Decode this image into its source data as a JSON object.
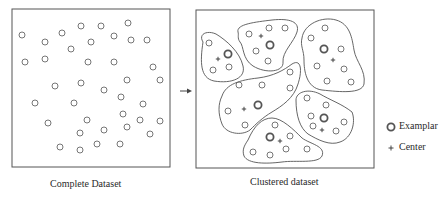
{
  "colors": {
    "stroke": "#555555",
    "point": "#666666",
    "exemplar": "#555555",
    "text": "#2a2a2a"
  },
  "left_panel": {
    "label": "Complete Dataset",
    "points": [
      [
        22,
        35
      ],
      [
        45,
        42
      ],
      [
        62,
        33
      ],
      [
        81,
        26
      ],
      [
        101,
        26
      ],
      [
        128,
        23
      ],
      [
        114,
        36
      ],
      [
        131,
        40
      ],
      [
        147,
        40
      ],
      [
        91,
        42
      ],
      [
        71,
        49
      ],
      [
        25,
        62
      ],
      [
        45,
        59
      ],
      [
        88,
        62
      ],
      [
        114,
        62
      ],
      [
        153,
        67
      ],
      [
        55,
        86
      ],
      [
        81,
        83
      ],
      [
        127,
        80
      ],
      [
        160,
        80
      ],
      [
        104,
        90
      ],
      [
        121,
        97
      ],
      [
        35,
        103
      ],
      [
        74,
        103
      ],
      [
        143,
        104
      ],
      [
        123,
        114
      ],
      [
        87,
        120
      ],
      [
        140,
        120
      ],
      [
        160,
        121
      ],
      [
        48,
        123
      ],
      [
        127,
        127
      ],
      [
        104,
        130
      ],
      [
        80,
        133
      ],
      [
        150,
        134
      ],
      [
        60,
        147
      ],
      [
        80,
        150
      ],
      [
        97,
        144
      ],
      [
        120,
        144
      ]
    ]
  },
  "arrow": {
    "symbol": "→"
  },
  "right_panel": {
    "label": "Clustered dataset",
    "clusters": [
      {
        "name": "cluster-a",
        "path": "M203,42 C198,34 207,30 216,34 C226,40 240,52 243,66 C246,78 232,84 214,81 C200,78 200,62 203,42 Z",
        "points": [
          [
            209,
            43
          ],
          [
            213,
            70
          ],
          [
            229,
            67
          ]
        ],
        "exemplar": [
          228,
          54
        ],
        "center": [
          218,
          59
        ]
      },
      {
        "name": "cluster-b",
        "path": "M238,32 C236,24 256,22 272,20 C290,18 300,22 297,32 C294,42 282,52 283,62 C284,72 266,74 253,66 C242,59 244,46 240,42 C237,38 239,35 238,32 Z",
        "points": [
          [
            249,
            34
          ],
          [
            269,
            28
          ],
          [
            285,
            28
          ],
          [
            256,
            51
          ],
          [
            268,
            61
          ]
        ],
        "exemplar": [
          270,
          45
        ],
        "center": [
          261,
          36
        ]
      },
      {
        "name": "cluster-c",
        "path": "M302,38 C304,24 322,16 336,20 C350,24 352,38 354,50 C356,62 366,70 364,84 C362,94 340,92 322,90 C306,88 304,70 304,60 C304,50 300,46 302,38 Z",
        "points": [
          [
            325,
            28
          ],
          [
            311,
            38
          ],
          [
            341,
            49
          ],
          [
            317,
            66
          ],
          [
            344,
            69
          ],
          [
            327,
            81
          ],
          [
            351,
            82
          ]
        ],
        "exemplar": [
          324,
          49
        ],
        "center": [
          333,
          60
        ]
      },
      {
        "name": "cluster-d",
        "path": "M222,96 C226,84 240,80 258,78 C274,76 284,70 292,64 C302,58 302,72 298,84 C294,98 282,106 272,112 C262,118 256,124 250,130 C242,136 226,134 222,124 C218,114 218,104 222,96 Z",
        "points": [
          [
            239,
            85
          ],
          [
            262,
            85
          ],
          [
            290,
            88
          ],
          [
            290,
            72
          ],
          [
            228,
            111
          ],
          [
            245,
            125
          ]
        ],
        "exemplar": [
          258,
          105
        ],
        "center": [
          244,
          109
        ]
      },
      {
        "name": "cluster-e",
        "path": "M296,100 C296,92 308,88 320,94 C330,100 342,104 352,112 C356,122 352,138 340,142 C330,146 318,140 308,134 C300,128 296,116 296,100 Z",
        "points": [
          [
            307,
            98
          ],
          [
            326,
            105
          ],
          [
            311,
            116
          ],
          [
            313,
            126
          ],
          [
            336,
            131
          ],
          [
            344,
            122
          ]
        ],
        "exemplar": [
          324,
          118
        ],
        "center": [
          322,
          130
        ]
      },
      {
        "name": "cluster-f",
        "path": "M248,140 C254,126 262,118 272,118 C282,118 294,130 302,138 C310,144 326,146 322,156 C318,164 296,160 282,162 C266,164 248,164 244,156 C242,150 244,146 248,140 Z",
        "points": [
          [
            275,
            125
          ],
          [
            290,
            136
          ],
          [
            253,
            152
          ],
          [
            270,
            155
          ],
          [
            286,
            149
          ],
          [
            307,
            149
          ]
        ],
        "exemplar": [
          270,
          137
        ],
        "center": [
          280,
          141
        ]
      }
    ]
  },
  "legend": {
    "items": [
      {
        "symbol": "exemplar",
        "label": "Examplar"
      },
      {
        "symbol": "center",
        "label": "Center"
      }
    ]
  }
}
